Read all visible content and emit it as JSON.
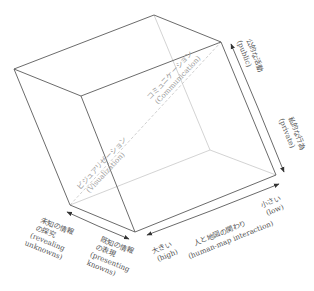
{
  "diagram": {
    "type": "cartography-cube",
    "axes": {
      "use": {
        "start_label_ja": "公的な活動",
        "start_label_en": "(public)",
        "end_label_ja": "私的な行為",
        "end_label_en": "(private)"
      },
      "interaction": {
        "title_ja": "人と地図の関わり",
        "title_en": "(human-map interaction)",
        "high_label_ja": "大きい",
        "high_label_en": "(high)",
        "low_label_ja": "小さい",
        "low_label_en": "(low)"
      },
      "knowledge": {
        "unknown_ja_1": "未知の情報",
        "unknown_ja_2": "の探究",
        "unknown_en_1": "(revealing",
        "unknown_en_2": "unknowns)",
        "known_ja_1": "既知の情報",
        "known_ja_2": "の表現",
        "known_en_1": "(presenting",
        "known_en_2": "knowns)"
      }
    },
    "diagonal": {
      "visualization_ja": "ビジュアリゼーション",
      "visualization_en": "(Visualization)",
      "communication_ja": "コミュニケーション",
      "communication_en": "(Communication)"
    },
    "colors": {
      "edge": "#5a5a5a",
      "hidden_edge": "#c8c8c8",
      "text": "#555555",
      "diagonal_text": "#9a9a9a"
    }
  }
}
